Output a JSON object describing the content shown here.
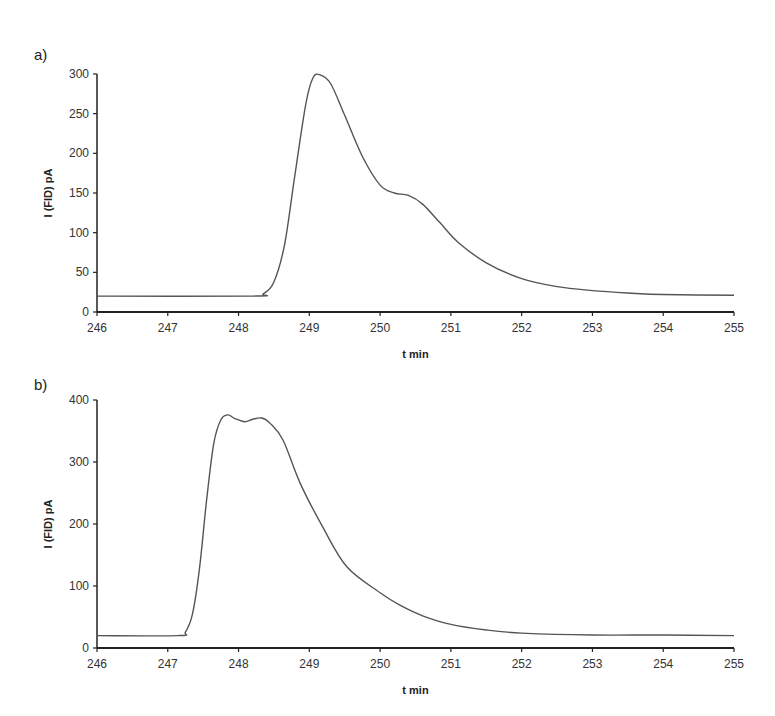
{
  "figure": {
    "panels": [
      "a)",
      "b)"
    ]
  },
  "chart_data": [
    {
      "type": "line",
      "panel_label": "a)",
      "title": "",
      "xlabel": "t min",
      "ylabel": "I (FID) pA",
      "xlim": [
        246,
        255
      ],
      "ylim": [
        0,
        300
      ],
      "xticks": [
        246,
        247,
        248,
        249,
        250,
        251,
        252,
        253,
        254,
        255
      ],
      "yticks": [
        0,
        50,
        100,
        150,
        200,
        250,
        300
      ],
      "grid": false,
      "legend": null,
      "series": [
        {
          "name": "FID signal a",
          "x": [
            246,
            248.2,
            248.35,
            248.5,
            248.65,
            248.8,
            248.95,
            249.05,
            249.15,
            249.3,
            249.5,
            249.75,
            250.0,
            250.2,
            250.4,
            250.6,
            250.85,
            251.1,
            251.5,
            252.0,
            252.5,
            253.0,
            253.5,
            254.0,
            255.0
          ],
          "y": [
            20,
            20,
            23,
            38,
            85,
            175,
            262,
            295,
            299,
            288,
            248,
            196,
            160,
            150,
            147,
            136,
            112,
            88,
            62,
            42,
            32,
            27,
            24,
            22,
            21
          ]
        }
      ]
    },
    {
      "type": "line",
      "panel_label": "b)",
      "title": "",
      "xlabel": "t min",
      "ylabel": "I (FID) pA",
      "xlim": [
        246,
        255
      ],
      "ylim": [
        0,
        400
      ],
      "xticks": [
        246,
        247,
        248,
        249,
        250,
        251,
        252,
        253,
        254,
        255
      ],
      "yticks": [
        0,
        100,
        200,
        300,
        400
      ],
      "grid": false,
      "legend": null,
      "series": [
        {
          "name": "FID signal b",
          "x": [
            246,
            247.15,
            247.25,
            247.35,
            247.45,
            247.55,
            247.65,
            247.75,
            247.85,
            247.95,
            248.09,
            248.2,
            248.33,
            248.45,
            248.63,
            248.87,
            249.19,
            249.53,
            250.0,
            250.28,
            250.6,
            251.0,
            251.5,
            252.0,
            253.0,
            254.0,
            255.0
          ],
          "y": [
            20,
            20,
            26,
            55,
            130,
            240,
            330,
            368,
            376,
            370,
            365,
            369,
            371,
            362,
            335,
            266,
            195,
            131,
            89,
            69,
            52,
            38,
            29,
            24,
            21,
            21,
            20
          ]
        }
      ]
    }
  ]
}
